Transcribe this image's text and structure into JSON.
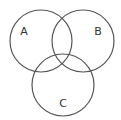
{
  "diagram": {
    "type": "venn",
    "stroke_color": "#555555",
    "label_color": "#333333",
    "background": "#ffffff",
    "sets": [
      {
        "label": "A",
        "cx": 41,
        "cy": 41,
        "r": 31,
        "label_x": 24,
        "label_y": 32
      },
      {
        "label": "B",
        "cx": 83,
        "cy": 41,
        "r": 31,
        "label_x": 98,
        "label_y": 32
      },
      {
        "label": "C",
        "cx": 63,
        "cy": 85,
        "r": 31,
        "label_x": 63,
        "label_y": 104
      }
    ]
  }
}
